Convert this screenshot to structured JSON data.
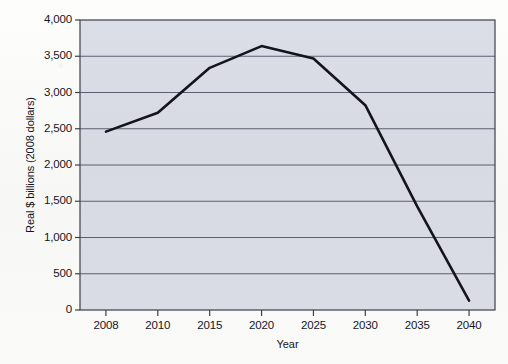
{
  "chart_data": {
    "type": "line",
    "title": "",
    "subtitle": "",
    "xlabel": "Year",
    "ylabel": "Real $ billions (2008 dollars)",
    "categories": [
      "2008",
      "2010",
      "2015",
      "2020",
      "2025",
      "2030",
      "2035",
      "2040"
    ],
    "values": [
      2460,
      2720,
      3340,
      3640,
      3470,
      2825,
      1430,
      130
    ],
    "series": [
      {
        "name": "",
        "values": [
          2460,
          2720,
          3340,
          3640,
          3470,
          2825,
          1430,
          130
        ]
      }
    ],
    "ylim": [
      0,
      4000
    ],
    "yticks": [
      0,
      500,
      1000,
      1500,
      2000,
      2500,
      3000,
      3500,
      4000
    ],
    "ytick_labels": [
      "0",
      "500",
      "1,000",
      "1,500",
      "2,000",
      "2,500",
      "3,000",
      "3,500",
      "4,000"
    ],
    "xtick_labels": [
      "2008",
      "2010",
      "2015",
      "2020",
      "2025",
      "2030",
      "2035",
      "2040"
    ],
    "grid": true,
    "grid_axis": "y",
    "legend": false,
    "legend_position": "none",
    "annotations": []
  },
  "style": {
    "line_color": "#14141e",
    "plot_background": "#d8dae4",
    "page_background": "#fbfbfa",
    "grid_color": "#5b5f70",
    "axis_color": "#3c404e",
    "text_color": "#15151c"
  }
}
